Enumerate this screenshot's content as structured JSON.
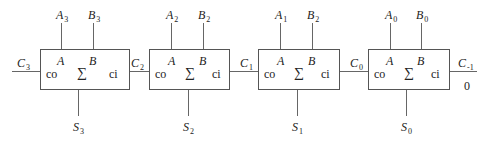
{
  "diagram": {
    "title": "",
    "type": "4-bit ripple carry adder",
    "blocks": [
      {
        "id": "FA3",
        "a_in": "A",
        "a_in_sub": "3",
        "b_in": "B",
        "b_in_sub": "3",
        "sum_out": "S",
        "sum_out_sub": "3",
        "pin_a": "A",
        "pin_b": "B",
        "pin_co": "co",
        "pin_sum": "∑",
        "pin_ci": "ci"
      },
      {
        "id": "FA2",
        "a_in": "A",
        "a_in_sub": "2",
        "b_in": "B",
        "b_in_sub": "2",
        "sum_out": "S",
        "sum_out_sub": "2",
        "pin_a": "A",
        "pin_b": "B",
        "pin_co": "co",
        "pin_sum": "∑",
        "pin_ci": "ci"
      },
      {
        "id": "FA1",
        "a_in": "A",
        "a_in_sub": "1",
        "b_in": "B",
        "b_in_sub": "2",
        "sum_out": "S",
        "sum_out_sub": "1",
        "pin_a": "A",
        "pin_b": "B",
        "pin_co": "co",
        "pin_sum": "∑",
        "pin_ci": "ci"
      },
      {
        "id": "FA0",
        "a_in": "A",
        "a_in_sub": "0",
        "b_in": "B",
        "b_in_sub": "0",
        "sum_out": "S",
        "sum_out_sub": "0",
        "pin_a": "A",
        "pin_b": "B",
        "pin_co": "co",
        "pin_sum": "∑",
        "pin_ci": "ci"
      }
    ],
    "carries": [
      {
        "label": "C",
        "sub": "3"
      },
      {
        "label": "C",
        "sub": "2"
      },
      {
        "label": "C",
        "sub": "1"
      },
      {
        "label": "C",
        "sub": "0"
      },
      {
        "label": "C",
        "sub": "-1"
      }
    ],
    "carry_in_value": "0"
  }
}
